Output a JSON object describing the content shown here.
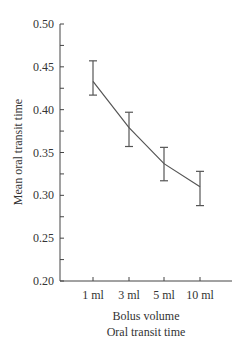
{
  "chart_data": {
    "type": "line",
    "title": "Oral transit time",
    "xlabel": "Bolus volume",
    "ylabel": "Mean oral transit time",
    "categories": [
      "1 ml",
      "3 ml",
      "5 ml",
      "10 ml"
    ],
    "series": [
      {
        "name": "Mean oral transit time",
        "values": [
          0.433,
          0.379,
          0.337,
          0.31
        ],
        "error_low": [
          0.417,
          0.357,
          0.317,
          0.288
        ],
        "error_high": [
          0.457,
          0.397,
          0.356,
          0.328
        ]
      }
    ],
    "ylim": [
      0.2,
      0.5
    ],
    "yticks": [
      "0.20",
      "0.25",
      "0.30",
      "0.35",
      "0.40",
      "0.45",
      "0.50"
    ],
    "grid": false,
    "legend": "none",
    "colors": {
      "line": "#555555",
      "axis": "#444444",
      "text": "#333333"
    }
  }
}
